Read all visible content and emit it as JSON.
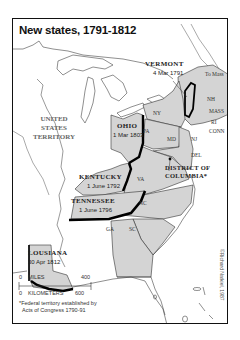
{
  "map": {
    "title": "New states, 1791-1812",
    "territory_label": [
      "UNITED",
      "STATES",
      "TERRITORY"
    ],
    "new_states": [
      {
        "name": "VERMONT",
        "date": "4 Mar 1791"
      },
      {
        "name": "KENTUCKY",
        "date": "1 June 1792"
      },
      {
        "name": "TENNESSEE",
        "date": "1 June 1796"
      },
      {
        "name": "OHIO",
        "date": "1 Mar 1803"
      },
      {
        "name": "LOUSIANA",
        "date": "30 Apr 1812"
      }
    ],
    "existing_states": {
      "to_mass": "To Mass",
      "nh": "NH",
      "mass": "MASS",
      "ri": "RI",
      "conn": "CONN",
      "ny": "NY",
      "pa": "PA",
      "nj": "NJ",
      "md": "MD",
      "del": "DEL",
      "va": "VA",
      "nc": "NC",
      "sc": "SC",
      "ga": "GA"
    },
    "district": {
      "line1": "DISTRICT OF",
      "line2": "COLUMBIA*"
    },
    "scale": {
      "miles_label": "MILES",
      "miles_zero": "0",
      "miles_max": "400",
      "km_label": "KILOMETERS",
      "km_zero": "0",
      "km_max": "600"
    },
    "footnote": {
      "line1": "*Federal territory established by",
      "line2": "Acts of Congress 1790-91"
    },
    "credit": "©Richard Natkiel, 1987",
    "colors": {
      "states_fill": "#d4d4d4",
      "new_state_border": "#000000",
      "land_fill": "#ffffff",
      "line": "#333333"
    }
  }
}
